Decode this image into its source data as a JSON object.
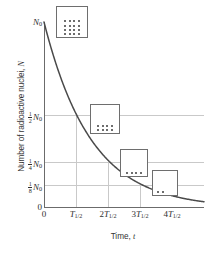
{
  "chart_data": {
    "type": "line",
    "title": "",
    "xlabel": "Time, t",
    "ylabel": "Number of radioactive nuclei, N",
    "xlim": [
      0,
      4.9
    ],
    "ylim": [
      0,
      1.0
    ],
    "grid": true,
    "legend": "none",
    "x_tick_labels": [
      "0",
      "T1/2",
      "2T1/2",
      "3T1/2",
      "4T1/2"
    ],
    "x_tick_values": [
      0,
      1,
      2,
      3,
      4
    ],
    "y_tick_labels": [
      "0",
      "1/8 N0",
      "1/4 N0",
      "1/2 N0",
      "N0"
    ],
    "y_tick_values": [
      0,
      0.125,
      0.25,
      0.5,
      1.0
    ],
    "series": [
      {
        "name": "Radioactive decay",
        "equation": "N = N0 * (1/2)^(t / T1/2)",
        "x": [
          0,
          0.25,
          0.5,
          0.75,
          1,
          1.25,
          1.5,
          1.75,
          2,
          2.25,
          2.5,
          2.75,
          3,
          3.25,
          3.5,
          3.75,
          4,
          4.25,
          4.5,
          4.75,
          4.9
        ],
        "y": [
          1.0,
          0.841,
          0.707,
          0.595,
          0.5,
          0.42,
          0.354,
          0.297,
          0.25,
          0.21,
          0.177,
          0.149,
          0.125,
          0.105,
          0.088,
          0.074,
          0.0625,
          0.053,
          0.044,
          0.037,
          0.034
        ]
      }
    ],
    "annotations": [
      {
        "label": "sample at t = 0",
        "nuclei_count": 16,
        "rows": [
          4,
          4,
          4,
          4
        ]
      },
      {
        "label": "sample at t = T1/2",
        "nuclei_count": 8,
        "rows": [
          4,
          4
        ]
      },
      {
        "label": "sample at t = 2T1/2",
        "nuclei_count": 4,
        "rows": [
          4
        ]
      },
      {
        "label": "sample at t = 3T1/2",
        "nuclei_count": 2,
        "rows": [
          2
        ]
      }
    ],
    "colors": {
      "curve": "#4a4a4a",
      "axis": "#6b6b6b",
      "grid": "#c9c9c9",
      "box_border": "#6e6e6e",
      "dot": "#3d3d3d",
      "text": "#2f2f2f"
    }
  },
  "axes": {
    "y_title_prefix": "Number of radioactive nuclei, ",
    "y_title_symbol": "N",
    "x_title_prefix": "Time, ",
    "x_title_symbol": "t",
    "y_ticks": [
      {
        "id": "n0",
        "symbol": "N",
        "subscript": "0",
        "num": "",
        "den": ""
      },
      {
        "id": "half-n0",
        "symbol": "N",
        "subscript": "0",
        "num": "1",
        "den": "2"
      },
      {
        "id": "quarter-n0",
        "symbol": "N",
        "subscript": "0",
        "num": "1",
        "den": "4"
      },
      {
        "id": "eighth-n0",
        "symbol": "N",
        "subscript": "0",
        "num": "1",
        "den": "8"
      },
      {
        "id": "zero",
        "symbol": "0",
        "subscript": "",
        "num": "",
        "den": ""
      }
    ],
    "x_ticks": [
      {
        "id": "origin",
        "coefficient": "0",
        "symbol": "",
        "subscript": ""
      },
      {
        "id": "t-half",
        "coefficient": "",
        "symbol": "T",
        "subscript": "1/2"
      },
      {
        "id": "t-2half",
        "coefficient": "2",
        "symbol": "T",
        "subscript": "1/2"
      },
      {
        "id": "t-3half",
        "coefficient": "3",
        "symbol": "T",
        "subscript": "1/2"
      },
      {
        "id": "t-4half",
        "coefficient": "4",
        "symbol": "T",
        "subscript": "1/2"
      }
    ]
  }
}
